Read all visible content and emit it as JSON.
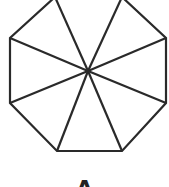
{
  "diagram": {
    "type": "octagon-divided-into-8-triangles",
    "stroke_color": "#2a2a2a",
    "stroke_width": 2.2,
    "background": "#ffffff",
    "center": [
      88,
      71
    ],
    "vertices": [
      [
        55,
        -3
      ],
      [
        122,
        -3
      ],
      [
        166,
        38
      ],
      [
        166,
        103
      ],
      [
        122,
        151
      ],
      [
        57,
        151
      ],
      [
        10,
        103
      ],
      [
        10,
        38
      ]
    ],
    "partial_label": "A"
  }
}
